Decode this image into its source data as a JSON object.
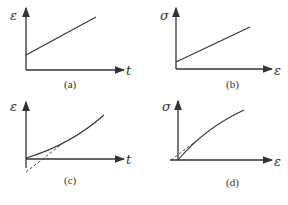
{
  "panels": [
    {
      "id": "a",
      "caption": "(a)",
      "y_label": "ε",
      "x_label": "t",
      "curve": "straight line with positive intercept"
    },
    {
      "id": "b",
      "caption": "(b)",
      "y_label": "σ",
      "x_label": "ε",
      "curve": "straight line with positive intercept"
    },
    {
      "id": "c",
      "caption": "(c)",
      "y_label": "ε",
      "x_label": "t",
      "curve": "concave-up curve with dashed tangent extension below origin"
    },
    {
      "id": "d",
      "caption": "(d)",
      "y_label": "σ",
      "x_label": "ε",
      "curve": "concave-down curve from origin with dashed tangent offset"
    }
  ]
}
